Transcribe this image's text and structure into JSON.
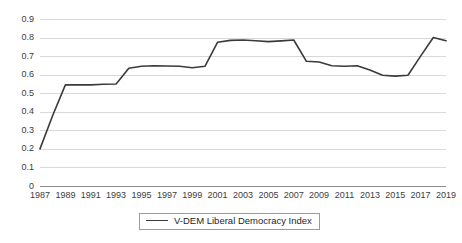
{
  "chart_data": {
    "type": "line",
    "title": "",
    "xlabel": "",
    "ylabel": "",
    "grid": true,
    "legend_position": "bottom",
    "xlim": [
      1987,
      2019
    ],
    "ylim": [
      0,
      0.9
    ],
    "ytick_labels": [
      "0.9",
      "0.8",
      "0.7",
      "0.6",
      "0.5",
      "0.4",
      "0.3",
      "0.2",
      "0.1",
      "0"
    ],
    "ytick_values": [
      0.9,
      0.8,
      0.7,
      0.6,
      0.5,
      0.4,
      0.3,
      0.2,
      0.1,
      0
    ],
    "xtick_labels": [
      "1987",
      "1989",
      "1991",
      "1993",
      "1995",
      "1997",
      "1999",
      "2001",
      "2003",
      "2005",
      "2007",
      "2009",
      "2011",
      "2013",
      "2015",
      "2017",
      "2019"
    ],
    "xtick_values": [
      1987,
      1989,
      1991,
      1993,
      1995,
      1997,
      1999,
      2001,
      2003,
      2005,
      2007,
      2009,
      2011,
      2013,
      2015,
      2017,
      2019
    ],
    "x": [
      1987,
      1988,
      1989,
      1990,
      1991,
      1992,
      1993,
      1994,
      1995,
      1996,
      1997,
      1998,
      1999,
      2000,
      2001,
      2002,
      2003,
      2004,
      2005,
      2006,
      2007,
      2008,
      2009,
      2010,
      2011,
      2012,
      2013,
      2014,
      2015,
      2016,
      2017,
      2018,
      2019
    ],
    "series": [
      {
        "name": "V-DEM Liberal Democracy Index",
        "color": "#3a3a3a",
        "values": [
          0.2,
          0.38,
          0.545,
          0.545,
          0.545,
          0.548,
          0.55,
          0.635,
          0.645,
          0.648,
          0.647,
          0.645,
          0.637,
          0.645,
          0.775,
          0.785,
          0.787,
          0.783,
          0.778,
          0.782,
          0.787,
          0.672,
          0.668,
          0.648,
          0.645,
          0.648,
          0.625,
          0.597,
          0.592,
          0.597,
          0.7,
          0.8,
          0.783
        ]
      }
    ]
  },
  "legend": {
    "items": [
      {
        "label": "V-DEM Liberal Democracy Index"
      }
    ]
  }
}
